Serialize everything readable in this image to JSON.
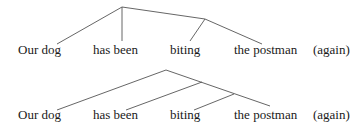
{
  "diagrams": [
    {
      "name": "tree-top",
      "words": [
        {
          "text": "Our dog",
          "x": 18,
          "y": 43
        },
        {
          "text": "has been",
          "x": 93,
          "y": 43
        },
        {
          "text": "biting",
          "x": 170,
          "y": 43
        },
        {
          "text": "the postman",
          "x": 234,
          "y": 43
        },
        {
          "text": "(again)",
          "x": 313,
          "y": 43
        }
      ]
    },
    {
      "name": "tree-bottom",
      "words": [
        {
          "text": "Our dog",
          "x": 18,
          "y": 108
        },
        {
          "text": "has been",
          "x": 93,
          "y": 108
        },
        {
          "text": "biting",
          "x": 170,
          "y": 108
        },
        {
          "text": "the postman",
          "x": 234,
          "y": 108
        },
        {
          "text": "(again)",
          "x": 313,
          "y": 108
        }
      ]
    }
  ],
  "colors": {
    "line": "#555555",
    "text": "#1a1a1a"
  }
}
